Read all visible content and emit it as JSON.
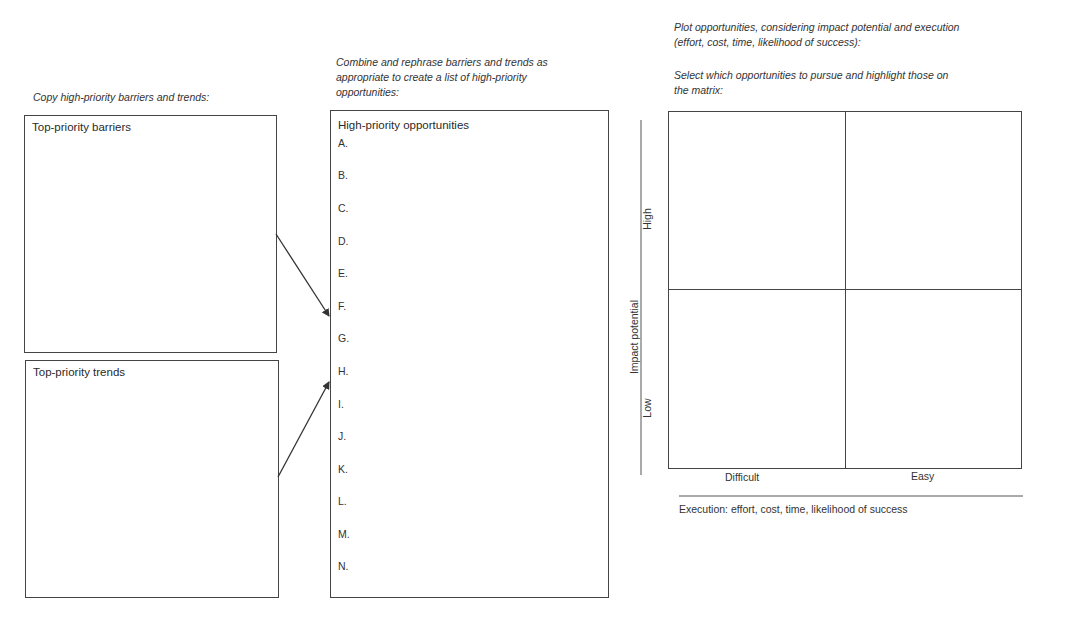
{
  "instructions": {
    "copy": "Copy high-priority barriers and trends:",
    "combine": "Combine and rephrase barriers and trends as appropriate to create a list of high-priority opportunities:",
    "combine_lines": [
      "Combine and rephrase barriers and trends as",
      "appropriate to create a list of high-priority",
      "opportunities:"
    ],
    "plot_lines": [
      "Plot opportunities, considering impact potential and execution",
      "(effort, cost, time, likelihood of success):"
    ],
    "select_lines": [
      "Select which opportunities to pursue and highlight those on",
      "the matrix:"
    ]
  },
  "barriers_box": {
    "title": "Top-priority barriers"
  },
  "trends_box": {
    "title": "Top-priority trends"
  },
  "opportunities_box": {
    "title": "High-priority opportunities",
    "items": [
      "A.",
      "B.",
      "C.",
      "D.",
      "E.",
      "F.",
      "G.",
      "H.",
      "I.",
      "J.",
      "K.",
      "L.",
      "M.",
      "N."
    ]
  },
  "matrix": {
    "y_axis_title": "Impact potential",
    "y_high": "High",
    "y_low": "Low",
    "x_left": "Difficult",
    "x_right": "Easy",
    "x_axis_title": "Execution: effort, cost, time, likelihood of success"
  },
  "colors": {
    "line": "#444444",
    "text": "#2a2a2a",
    "background": "#ffffff"
  }
}
